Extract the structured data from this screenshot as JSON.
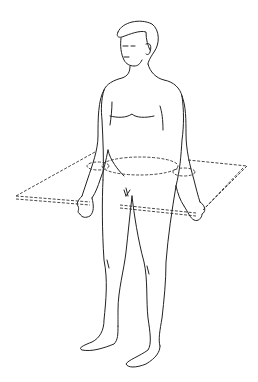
{
  "figure": {
    "annotation": "transverse (horizontal) plane",
    "stroke_color": "#222222",
    "background_color": "#ffffff"
  }
}
